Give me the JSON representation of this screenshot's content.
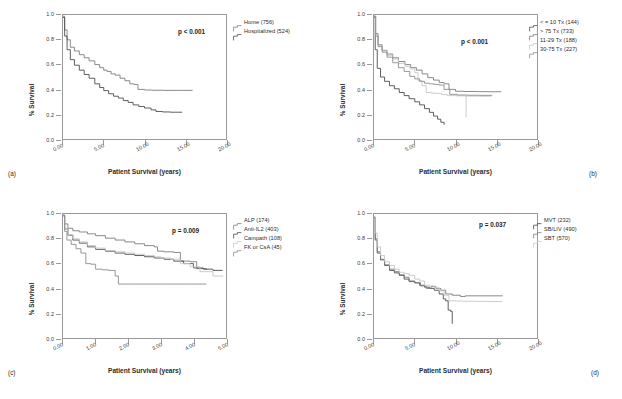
{
  "figure": {
    "axis_title_x": "Patient Survival (years)",
    "axis_title_y": "% Survival",
    "colors": {
      "dark": "#4d4d4d",
      "mid": "#7d7d7d",
      "light": "#b9b9b9",
      "xlight": "#d2d2d2",
      "axis": "#9a9a9a",
      "text": "#2b2b2b"
    }
  },
  "panels": [
    {
      "tag": "(a)",
      "pvalue": "p < 0.001",
      "legend": [
        {
          "label": "Home (756)",
          "color": "#7d7d7d"
        },
        {
          "label": "Hospitalized (524)",
          "color": "#4d4d4d"
        }
      ]
    },
    {
      "tag": "(b)",
      "pvalue": "p < 0.001",
      "legend": [
        {
          "label": "< = 10 Tx (144)",
          "color": "#4d4d4d"
        },
        {
          "label": "> 75 Tx (733)",
          "color": "#7d7d7d"
        },
        {
          "label": "11-29 Tx (188)",
          "color": "#c6c6c6"
        },
        {
          "label": "30-75 Tx (227)",
          "color": "#8d8d8d"
        }
      ]
    },
    {
      "tag": "(c)",
      "pvalue": "p = 0.009",
      "legend": [
        {
          "label": "ALP (174)",
          "color": "#7d7d7d"
        },
        {
          "label": "Anti-IL2 (403)",
          "color": "#4d4d4d"
        },
        {
          "label": "Campath (108)",
          "color": "#c6c6c6"
        },
        {
          "label": "FK or CsA (45)",
          "color": "#8d8d8d"
        }
      ]
    },
    {
      "tag": "(d)",
      "pvalue": "p = 0.037",
      "legend": [
        {
          "label": "MVT (232)",
          "color": "#4d4d4d"
        },
        {
          "label": "SB/LIV (490)",
          "color": "#7d7d7d"
        },
        {
          "label": "SBT (570)",
          "color": "#c6c6c6"
        }
      ]
    }
  ],
  "chart_data": [
    {
      "panel": "(a)",
      "type": "line",
      "title": "",
      "xlabel": "Patient Survival (years)",
      "ylabel": "% Survival",
      "xlim": [
        0,
        20
      ],
      "ylim": [
        0,
        1
      ],
      "xticks": [
        "0.00",
        "5.00",
        "10.00",
        "15.00",
        "20.00"
      ],
      "yticks": [
        "0.0",
        "0.2",
        "0.4",
        "0.6",
        "0.8",
        "1.0"
      ],
      "grid": false,
      "legend_position": "right-outside",
      "annotations": [
        "p < 0.001"
      ],
      "series": [
        {
          "name": "Home (756)",
          "color": "#7d7d7d",
          "x": [
            0,
            0.2,
            0.5,
            0.9,
            1.4,
            2.0,
            2.6,
            3.2,
            3.9,
            4.5,
            5.0,
            5.4,
            5.9,
            6.4,
            7.0,
            7.6,
            8.2,
            8.7,
            9.2,
            10.0,
            11.0,
            12.5,
            14.0,
            15.9
          ],
          "y": [
            0.99,
            0.88,
            0.8,
            0.74,
            0.71,
            0.68,
            0.655,
            0.63,
            0.6,
            0.575,
            0.555,
            0.545,
            0.525,
            0.515,
            0.49,
            0.47,
            0.445,
            0.44,
            0.4,
            0.395,
            0.393,
            0.392,
            0.392,
            0.392
          ]
        },
        {
          "name": "Hospitalized (524)",
          "color": "#4d4d4d",
          "x": [
            0,
            0.2,
            0.5,
            0.9,
            1.4,
            2.0,
            2.6,
            3.2,
            3.9,
            4.5,
            5.0,
            5.6,
            6.2,
            6.8,
            7.4,
            8.0,
            8.6,
            9.3,
            10.0,
            10.8,
            11.4,
            12.2,
            13.2,
            14.6
          ],
          "y": [
            0.98,
            0.83,
            0.72,
            0.64,
            0.595,
            0.555,
            0.52,
            0.49,
            0.445,
            0.415,
            0.39,
            0.365,
            0.345,
            0.33,
            0.31,
            0.295,
            0.275,
            0.262,
            0.25,
            0.235,
            0.222,
            0.218,
            0.216,
            0.215
          ]
        }
      ]
    },
    {
      "panel": "(b)",
      "type": "line",
      "title": "",
      "xlabel": "Patient Survival (years)",
      "ylabel": "% Survival",
      "xlim": [
        0,
        20
      ],
      "ylim": [
        0,
        1
      ],
      "xticks": [
        "0.00",
        "5.00",
        "10.00",
        "15.00",
        "20.00"
      ],
      "yticks": [
        "0.0",
        "0.2",
        "0.4",
        "0.6",
        "0.8",
        "1.0"
      ],
      "grid": false,
      "legend_position": "right-outside",
      "annotations": [
        "p < 0.001"
      ],
      "series": [
        {
          "name": "< = 10 Tx (144)",
          "color": "#4d4d4d",
          "x": [
            0,
            0.15,
            0.4,
            0.8,
            1.3,
            1.9,
            2.5,
            3.1,
            3.7,
            4.3,
            5.0,
            5.6,
            6.2,
            6.8,
            7.3,
            7.8,
            8.2,
            8.6
          ],
          "y": [
            0.98,
            0.72,
            0.57,
            0.5,
            0.465,
            0.43,
            0.405,
            0.375,
            0.35,
            0.325,
            0.3,
            0.275,
            0.245,
            0.215,
            0.185,
            0.16,
            0.135,
            0.115
          ]
        },
        {
          "name": "> 75 Tx (733)",
          "color": "#7d7d7d",
          "x": [
            0,
            0.2,
            0.5,
            1.0,
            1.6,
            2.3,
            3.0,
            3.8,
            4.5,
            5.2,
            5.9,
            6.6,
            7.3,
            8.0,
            8.6,
            9.2,
            10.0,
            11.0,
            12.5,
            14.0,
            15.6
          ],
          "y": [
            0.99,
            0.85,
            0.76,
            0.715,
            0.685,
            0.655,
            0.625,
            0.6,
            0.575,
            0.555,
            0.525,
            0.495,
            0.475,
            0.455,
            0.445,
            0.4,
            0.385,
            0.383,
            0.382,
            0.381,
            0.38
          ]
        },
        {
          "name": "11-29 Tx (188)",
          "color": "#c6c6c6",
          "x": [
            0,
            0.2,
            0.5,
            1.0,
            1.6,
            2.3,
            3.0,
            3.8,
            4.4,
            5.0,
            5.4,
            5.9,
            6.4,
            7.0,
            7.6,
            8.3,
            9.0,
            10.0,
            11.2,
            13.0,
            14.4
          ],
          "y": [
            0.985,
            0.84,
            0.755,
            0.71,
            0.675,
            0.645,
            0.61,
            0.585,
            0.565,
            0.535,
            0.47,
            0.43,
            0.375,
            0.37,
            0.368,
            0.358,
            0.35,
            0.348,
            0.346,
            0.345,
            0.345
          ]
        },
        {
          "name": "30-75 Tx (227)",
          "color": "#8d8d8d",
          "x": [
            0,
            0.2,
            0.5,
            1.0,
            1.6,
            2.3,
            3.0,
            3.7,
            4.4,
            5.0,
            5.6,
            6.2,
            6.8,
            7.4,
            8.0,
            8.6,
            9.3,
            10.2,
            11.5,
            13.0,
            14.5
          ],
          "y": [
            0.99,
            0.83,
            0.745,
            0.7,
            0.66,
            0.615,
            0.575,
            0.545,
            0.505,
            0.485,
            0.465,
            0.45,
            0.445,
            0.44,
            0.435,
            0.4,
            0.36,
            0.355,
            0.353,
            0.352,
            0.352
          ]
        },
        {
          "name": "censor-bar",
          "color": "#c6c6c6",
          "x": [
            11.3,
            11.3
          ],
          "y": [
            0.35,
            0.175
          ]
        }
      ]
    },
    {
      "panel": "(c)",
      "type": "line",
      "title": "",
      "xlabel": "Patient Survival (years)",
      "ylabel": "% Survival",
      "xlim": [
        0,
        5
      ],
      "ylim": [
        0,
        1
      ],
      "xticks": [
        "0.00",
        "1.00",
        "2.00",
        "3.00",
        "4.00",
        "5.00"
      ],
      "yticks": [
        "0.0",
        "0.2",
        "0.4",
        "0.6",
        "0.8",
        "1.0"
      ],
      "grid": false,
      "legend_position": "right-outside",
      "annotations": [
        "p = 0.009"
      ],
      "series": [
        {
          "name": "ALP (174)",
          "color": "#7d7d7d",
          "x": [
            0,
            0.05,
            0.15,
            0.3,
            0.5,
            0.75,
            1.0,
            1.3,
            1.6,
            1.9,
            2.2,
            2.5,
            2.8,
            2.9,
            3.1,
            3.4,
            3.6,
            3.9,
            4.1,
            4.4
          ],
          "y": [
            0.99,
            0.92,
            0.885,
            0.865,
            0.855,
            0.84,
            0.825,
            0.805,
            0.79,
            0.775,
            0.76,
            0.745,
            0.735,
            0.7,
            0.695,
            0.69,
            0.62,
            0.615,
            0.56,
            0.55
          ]
        },
        {
          "name": "Anti-IL2 (403)",
          "color": "#4d4d4d",
          "x": [
            0,
            0.05,
            0.15,
            0.3,
            0.5,
            0.75,
            1.0,
            1.3,
            1.6,
            1.9,
            2.2,
            2.5,
            2.8,
            3.1,
            3.4,
            3.7,
            4.0,
            4.3,
            4.6,
            4.9
          ],
          "y": [
            0.99,
            0.88,
            0.83,
            0.79,
            0.765,
            0.735,
            0.715,
            0.7,
            0.685,
            0.675,
            0.665,
            0.655,
            0.645,
            0.635,
            0.62,
            0.6,
            0.565,
            0.555,
            0.545,
            0.545
          ]
        },
        {
          "name": "Campath (108)",
          "color": "#c6c6c6",
          "x": [
            0,
            0.05,
            0.15,
            0.3,
            0.5,
            0.75,
            1.0,
            1.3,
            1.6,
            1.9,
            2.2,
            2.5,
            2.8,
            3.0,
            3.3,
            3.6,
            3.9,
            4.2,
            4.6,
            4.9
          ],
          "y": [
            0.985,
            0.885,
            0.835,
            0.8,
            0.775,
            0.745,
            0.725,
            0.705,
            0.695,
            0.685,
            0.675,
            0.665,
            0.655,
            0.645,
            0.635,
            0.6,
            0.575,
            0.535,
            0.5,
            0.495
          ]
        },
        {
          "name": "FK or CsA (45)",
          "color": "#8d8d8d",
          "x": [
            0,
            0.05,
            0.12,
            0.25,
            0.4,
            0.55,
            0.7,
            0.85,
            1.0,
            1.2,
            1.4,
            1.6,
            1.7,
            2.2,
            3.0,
            3.8,
            4.4
          ],
          "y": [
            0.985,
            0.86,
            0.79,
            0.755,
            0.72,
            0.685,
            0.6,
            0.595,
            0.555,
            0.55,
            0.545,
            0.5,
            0.435,
            0.435,
            0.435,
            0.435,
            0.435
          ]
        }
      ]
    },
    {
      "panel": "(d)",
      "type": "line",
      "title": "",
      "xlabel": "Patient Survival (years)",
      "ylabel": "% Survival",
      "xlim": [
        0,
        20
      ],
      "ylim": [
        0,
        1
      ],
      "xticks": [
        "0.00",
        "5.00",
        "10.00",
        "15.00",
        "20.00"
      ],
      "yticks": [
        "0.0",
        "0.2",
        "0.4",
        "0.6",
        "0.8",
        "1.0"
      ],
      "grid": false,
      "legend_position": "right-outside",
      "annotations": [
        "p = 0.037"
      ],
      "series": [
        {
          "name": "MVT (232)",
          "color": "#4d4d4d",
          "x": [
            0,
            0.15,
            0.4,
            0.8,
            1.3,
            1.9,
            2.5,
            3.1,
            3.7,
            4.3,
            5.0,
            5.6,
            6.2,
            6.8,
            7.4,
            8.0,
            8.5,
            8.8,
            9.1,
            9.4,
            9.6
          ],
          "y": [
            0.97,
            0.79,
            0.685,
            0.63,
            0.585,
            0.545,
            0.525,
            0.505,
            0.475,
            0.455,
            0.445,
            0.425,
            0.41,
            0.4,
            0.385,
            0.355,
            0.315,
            0.3,
            0.225,
            0.215,
            0.115
          ]
        },
        {
          "name": "SB/LIV (490)",
          "color": "#7d7d7d",
          "x": [
            0,
            0.15,
            0.4,
            0.8,
            1.3,
            1.9,
            2.5,
            3.1,
            3.7,
            4.3,
            5.0,
            5.7,
            6.4,
            7.0,
            7.6,
            8.2,
            8.8,
            9.6,
            10.6,
            11.2,
            12.5,
            14.0,
            15.8
          ],
          "y": [
            0.975,
            0.8,
            0.695,
            0.635,
            0.59,
            0.555,
            0.535,
            0.51,
            0.49,
            0.46,
            0.445,
            0.42,
            0.4,
            0.415,
            0.4,
            0.385,
            0.355,
            0.345,
            0.335,
            0.34,
            0.34,
            0.34,
            0.34
          ]
        },
        {
          "name": "SBT (570)",
          "color": "#c6c6c6",
          "x": [
            0,
            0.15,
            0.4,
            0.8,
            1.3,
            1.9,
            2.5,
            3.1,
            3.7,
            4.3,
            5.0,
            5.6,
            6.2,
            6.8,
            7.4,
            8.0,
            8.6,
            9.2,
            10.0,
            11.0,
            12.5,
            14.0,
            15.7
          ],
          "y": [
            0.98,
            0.845,
            0.735,
            0.665,
            0.615,
            0.585,
            0.555,
            0.53,
            0.52,
            0.505,
            0.475,
            0.46,
            0.425,
            0.42,
            0.405,
            0.38,
            0.345,
            0.3,
            0.298,
            0.296,
            0.295,
            0.294,
            0.293
          ]
        }
      ]
    }
  ]
}
